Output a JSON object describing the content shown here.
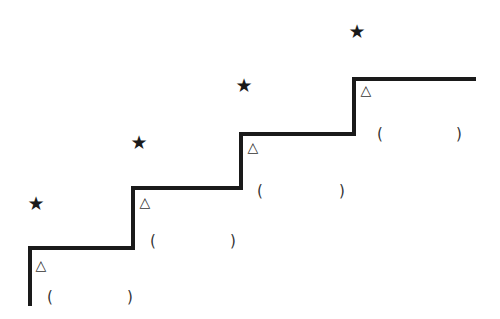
{
  "diagram": {
    "type": "staircase",
    "line_color": "#1a1a1a",
    "steps": [
      {
        "index": 1,
        "star": {
          "icon": "star-icon",
          "glyph": "★"
        },
        "marker": {
          "icon": "triangle-icon",
          "glyph": "△"
        },
        "blank": {
          "open": "(",
          "close": ")",
          "value": ""
        }
      },
      {
        "index": 2,
        "star": {
          "icon": "star-icon",
          "glyph": "★"
        },
        "marker": {
          "icon": "triangle-icon",
          "glyph": "△"
        },
        "blank": {
          "open": "(",
          "close": ")",
          "value": ""
        }
      },
      {
        "index": 3,
        "star": {
          "icon": "star-icon",
          "glyph": "★"
        },
        "marker": {
          "icon": "triangle-icon",
          "glyph": "△"
        },
        "blank": {
          "open": "(",
          "close": ")",
          "value": ""
        }
      },
      {
        "index": 4,
        "star": {
          "icon": "star-icon",
          "glyph": "★"
        },
        "marker": {
          "icon": "triangle-icon",
          "glyph": "△"
        },
        "blank": {
          "open": "(",
          "close": ")",
          "value": ""
        }
      }
    ]
  }
}
